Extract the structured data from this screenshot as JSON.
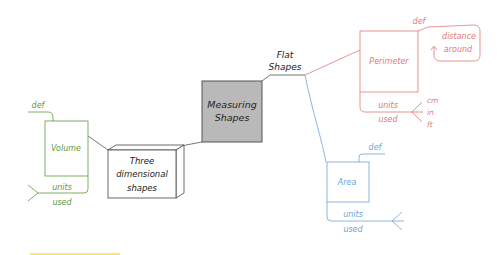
{
  "colors": {
    "volume": "#5f9a3c",
    "perimeter": "#e07a78",
    "area": "#6fa3d6",
    "center_fill": "#b9b9b9",
    "ink": "#333333",
    "highlight": "#f7ea6a"
  },
  "center": {
    "label_line1": "Measuring",
    "label_line2": "Shapes"
  },
  "flat": {
    "label_line1": "Flat",
    "label_line2": "Shapes"
  },
  "three_d": {
    "label_line1": "Three",
    "label_line2": "dimensional",
    "label_line3": "shapes"
  },
  "volume": {
    "title": "Volume",
    "def": "def",
    "units_line1": "units",
    "units_line2": "used"
  },
  "perimeter": {
    "title": "Perimeter",
    "def": "def",
    "def_text_line1": "distance",
    "def_text_line2": "around",
    "units_line1": "units",
    "units_line2": "used",
    "unit_values": [
      "cm",
      "in",
      "ft"
    ]
  },
  "area": {
    "title": "Area",
    "def": "def",
    "units_line1": "units",
    "units_line2": "used"
  }
}
